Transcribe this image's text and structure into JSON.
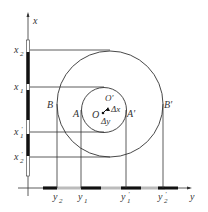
{
  "diagram": {
    "axes": {
      "vertical_label": "x",
      "horizontal_label": "y"
    },
    "x_ticks": [
      {
        "base": "x",
        "sub": "2",
        "prime": ""
      },
      {
        "base": "x",
        "sub": "1",
        "prime": ""
      },
      {
        "base": "x",
        "sub": "1",
        "prime": "′"
      },
      {
        "base": "x",
        "sub": "2",
        "prime": "′"
      }
    ],
    "y_ticks": [
      {
        "base": "y",
        "sub": "2",
        "prime": ""
      },
      {
        "base": "y",
        "sub": "1",
        "prime": ""
      },
      {
        "base": "y",
        "sub": "1",
        "prime": "′"
      },
      {
        "base": "y",
        "sub": "2",
        "prime": "′"
      }
    ],
    "points": {
      "B": "B",
      "A": "A",
      "A_prime": "A′",
      "B_prime": "B′",
      "O": "O",
      "O_prime": "O′",
      "dx": "Δx",
      "dy": "Δy"
    },
    "colors": {
      "line": "#333333",
      "bar_dark": "#111111",
      "bar_light": "#bbbbbb"
    }
  }
}
